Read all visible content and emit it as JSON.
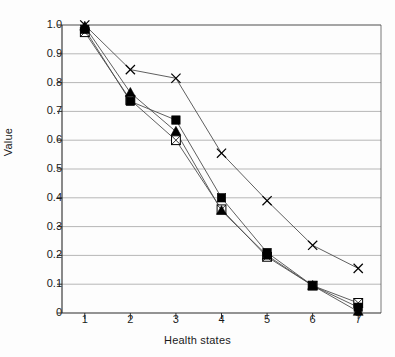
{
  "chart_data": {
    "type": "line",
    "title": "",
    "xlabel": "Health states",
    "ylabel": "Value",
    "x": [
      1,
      2,
      3,
      4,
      5,
      6,
      7
    ],
    "categories": [
      "1",
      "2",
      "3",
      "4",
      "5",
      "6",
      "7"
    ],
    "xlim": [
      0.5,
      7.5
    ],
    "ylim": [
      0,
      1.0
    ],
    "ytick_labels": [
      "1.0",
      "0.9",
      "0.8",
      "0.7",
      "0.6",
      "0.5",
      "0.4",
      "0.3",
      "0.2",
      "0.1",
      "0"
    ],
    "ytick_values": [
      1.0,
      0.9,
      0.8,
      0.7,
      0.6,
      0.5,
      0.4,
      0.3,
      0.2,
      0.1,
      0
    ],
    "xtick_labels": [
      "1",
      "2",
      "3",
      "4",
      "5",
      "6",
      "7"
    ],
    "grid": "horizontal",
    "legend": "none",
    "series": [
      {
        "name": "series-filled-square",
        "marker": "filled-square",
        "color": "#000000",
        "values": [
          0.985,
          0.735,
          0.67,
          0.4,
          0.21,
          0.095,
          0.02
        ]
      },
      {
        "name": "series-filled-triangle",
        "marker": "filled-triangle",
        "color": "#000000",
        "values": [
          0.995,
          0.765,
          0.63,
          0.355,
          0.2,
          0.095,
          0.005
        ]
      },
      {
        "name": "series-open-square",
        "marker": "open-square-with-x",
        "color": "#000000",
        "values": [
          0.975,
          0.74,
          0.6,
          0.36,
          0.195,
          0.095,
          0.035
        ]
      },
      {
        "name": "series-x-marker",
        "marker": "x-cross",
        "color": "#000000",
        "values": [
          1.0,
          0.845,
          0.815,
          0.555,
          0.39,
          0.235,
          0.155
        ]
      }
    ]
  },
  "axis": {
    "y_title": "Value",
    "x_title": "Health states"
  }
}
